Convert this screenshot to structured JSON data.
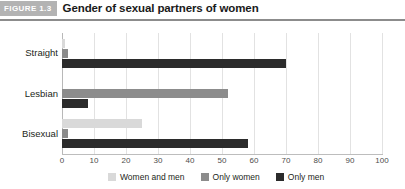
{
  "header": {
    "tag": "FIGURE 1.3",
    "title": "Gender of sexual partners of women"
  },
  "chart_data": {
    "type": "bar",
    "orientation": "horizontal",
    "title": "Gender of sexual partners of women",
    "xlabel": "",
    "ylabel": "",
    "categories": [
      "Straight",
      "Lesbian",
      "Bisexual"
    ],
    "series": [
      {
        "name": "Women and men",
        "color": "#d9d9d9",
        "values": [
          1,
          0,
          25
        ]
      },
      {
        "name": "Only women",
        "color": "#8c8c8c",
        "values": [
          2,
          52,
          2
        ]
      },
      {
        "name": "Only men",
        "color": "#2b2b2b",
        "values": [
          70,
          8,
          58
        ]
      }
    ],
    "xlim": [
      0,
      100
    ],
    "xticks": [
      0,
      10,
      20,
      30,
      40,
      50,
      60,
      70,
      80,
      90,
      100
    ],
    "grid": true,
    "legend_position": "bottom"
  },
  "colors": {
    "rule": "#8c8c8c",
    "tag_background": "#b3b3b3",
    "gridline": "#e2e2e2"
  }
}
